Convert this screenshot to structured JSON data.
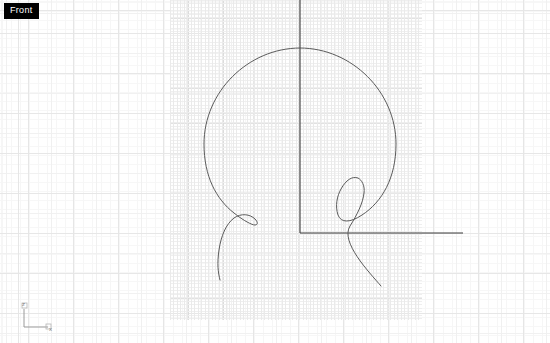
{
  "app": {
    "viewport_label": "Front",
    "background_color": "#ffffff"
  },
  "axis_gizmo": {
    "vertical_axis_label": "z",
    "horizontal_axis_label": "x",
    "color": "#808080"
  },
  "grid": {
    "major_color": "#e6e6e6",
    "minor_color": "#f0f0f0",
    "micro_color": "#f6f6f6",
    "dense_color": "#dcdcdc",
    "major_spacing_px": 45,
    "minor_spacing_px": 45,
    "dense_spacing_px": 3.5,
    "dense_region": {
      "x": 170,
      "y": 0,
      "width": 252,
      "height": 320
    }
  },
  "world_axes": {
    "z_axis_color": "#3a3a3a",
    "x_axis_color": "#3a3a3a",
    "origin": {
      "x": 300,
      "y": 233
    },
    "z_axis_top": {
      "x": 300,
      "y": 0
    },
    "x_axis_right": {
      "x": 463,
      "y": 233
    }
  },
  "geometry": {
    "curve_name": "spiral-curve",
    "curve_color": "#5a5a5a",
    "curve_width": 1,
    "center": {
      "x": 300,
      "y": 150
    },
    "radius": 95,
    "path": "M 300 48 C 352 48 396 92 396 144 C 396 178 382 202 362 215 C 350 223 341 223 338 215 C 335 206 337 196 341 189 C 346 180 352 176 358 178 C 362 180 365 186 364 193 C 363 203 357 215 350 226 C 340 242 369 272 381 286 M 300 48 C 248 48 204 92 204 144 C 204 176 216 199 234 213 C 244 221 252 225 255 225 C 258 225 258 222 255 219 C 250 214 241 213 234 218 C 226 224 221 236 219 250 C 217 264 218 272 220 280"
  }
}
